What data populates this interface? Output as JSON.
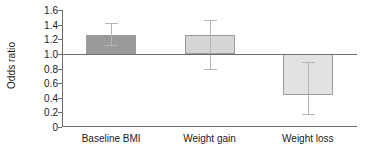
{
  "chart_data": {
    "type": "bar",
    "title": "",
    "xlabel": "",
    "ylabel": "Odds ratio",
    "categories": [
      "Baseline BMI",
      "Weight gain",
      "Weight loss"
    ],
    "values": [
      1.26,
      1.26,
      0.44
    ],
    "error_low": [
      1.12,
      0.79,
      0.18
    ],
    "error_high": [
      1.42,
      1.47,
      0.89
    ],
    "baseline": 1.0,
    "ylim": [
      0,
      1.6
    ],
    "yticks": [
      "0",
      "0.2",
      "0.4",
      "0.6",
      "0.8",
      "1.0",
      "1.2",
      "1.4",
      "1.6"
    ],
    "ytick_values": [
      0,
      0.2,
      0.4,
      0.6,
      0.8,
      1.0,
      1.2,
      1.4,
      1.6
    ],
    "grid": false,
    "legend": "none",
    "bar_colors": [
      "#9a9a9a",
      "#d6d6d6",
      "#e2e2e2"
    ],
    "bar_edge_color": "#9b9b9b",
    "error_bar_color": "#b4b4b4",
    "axis_color": "#6e6e6e",
    "text_color": "#1a1a1a",
    "background": "#ffffff"
  }
}
